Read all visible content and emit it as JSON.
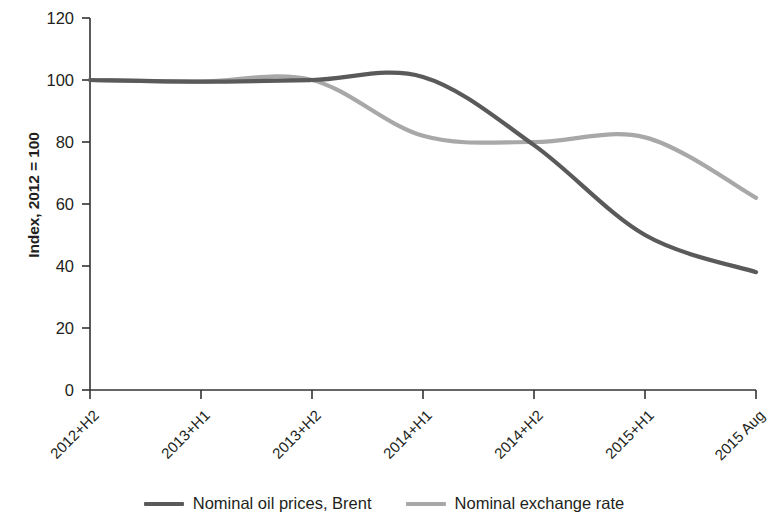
{
  "chart_data": {
    "type": "line",
    "title": "",
    "subtitle": "",
    "xlabel": "",
    "ylabel": "Index, 2012 = 100",
    "categories": [
      "2012+H2",
      "2013+H1",
      "2013+H2",
      "2014+H1",
      "2014+H2",
      "2015+H1",
      "2015 Aug"
    ],
    "yticks": [
      0,
      20,
      40,
      60,
      80,
      100,
      120
    ],
    "ylim": [
      0,
      120
    ],
    "grid": false,
    "legend_position": "bottom",
    "series": [
      {
        "name": "Nominal oil prices, Brent",
        "color": "#5a5a5a",
        "values": [
          100,
          99.5,
          100,
          101,
          79,
          50,
          38
        ]
      },
      {
        "name": "Nominal exchange rate",
        "color": "#a8a8a8",
        "values": [
          100,
          99.5,
          100,
          82,
          80,
          81.5,
          62
        ]
      }
    ]
  },
  "axes": {
    "y_title": "Index, 2012 = 100",
    "y_tick_labels": [
      "120",
      "100",
      "80",
      "60",
      "40",
      "20",
      "0"
    ],
    "x_tick_labels": [
      "2012+H2",
      "2013+H1",
      "2013+H2",
      "2014+H1",
      "2014+H2",
      "2015+H1",
      "2015 Aug"
    ]
  },
  "legend": {
    "items": [
      {
        "label": "Nominal oil prices, Brent",
        "color": "#5a5a5a"
      },
      {
        "label": "Nominal exchange rate",
        "color": "#a8a8a8"
      }
    ]
  },
  "colors": {
    "axis": "#333333",
    "text": "#231f20",
    "series_oil": "#5a5a5a",
    "series_fx": "#a8a8a8",
    "background": "#ffffff"
  }
}
